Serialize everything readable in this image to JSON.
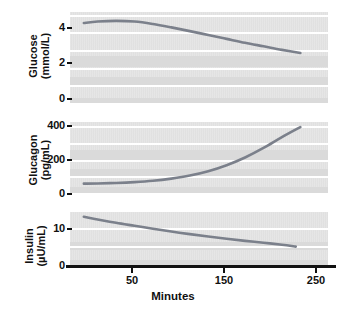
{
  "figure": {
    "xlabel": "Minutes",
    "line_color": "#7b808b",
    "panel_bg": "#e3e3e3",
    "band_color": "#dadada",
    "gridline_color": "#ffffff",
    "axis_color": "#111111"
  },
  "chart_data": [
    {
      "type": "line",
      "title": "",
      "xlabel": "Minutes",
      "ylabel": "Glucose (mmol/L)",
      "ylabel_lines": [
        "Glucose",
        "(mmol/L)"
      ],
      "units": "mmol/L",
      "xlim": [
        0,
        280
      ],
      "ylim": [
        0,
        5.2
      ],
      "yticks": [
        0,
        2,
        4
      ],
      "ytick_labels": [
        "0",
        "2",
        "4"
      ],
      "xticks": [
        50,
        150,
        250
      ],
      "xtick_labels": [
        "50",
        "150",
        "250"
      ],
      "grid": true,
      "legend": "none",
      "series": [
        {
          "name": "Glucose",
          "x": [
            15,
            30,
            50,
            70,
            90,
            110,
            130,
            150,
            170,
            190,
            210,
            230,
            250
          ],
          "values": [
            4.58,
            4.66,
            4.7,
            4.66,
            4.52,
            4.33,
            4.12,
            3.9,
            3.68,
            3.46,
            3.26,
            3.06,
            2.88
          ]
        }
      ]
    },
    {
      "type": "line",
      "title": "",
      "xlabel": "Minutes",
      "ylabel": "Glucagon (pg/mL)",
      "ylabel_lines": [
        "Glucagon",
        "(pg/mL)"
      ],
      "units": "pg/mL",
      "xlim": [
        0,
        280
      ],
      "ylim": [
        0,
        430
      ],
      "yticks": [
        0,
        200,
        400
      ],
      "ytick_labels": [
        "0",
        "200",
        "400"
      ],
      "xticks": [
        50,
        150,
        250
      ],
      "xtick_labels": [
        "50",
        "150",
        "250"
      ],
      "grid": true,
      "legend": "none",
      "series": [
        {
          "name": "Glucagon",
          "x": [
            15,
            30,
            50,
            70,
            90,
            110,
            130,
            150,
            170,
            190,
            210,
            230,
            250
          ],
          "values": [
            62,
            63,
            66,
            71,
            79,
            92,
            110,
            136,
            172,
            218,
            275,
            340,
            400
          ]
        }
      ]
    },
    {
      "type": "line",
      "title": "",
      "xlabel": "Minutes",
      "ylabel": "Insulin (µU/mL)",
      "ylabel_lines": [
        "Insulin",
        "(µU/mL)"
      ],
      "units": "µU/mL",
      "xlim": [
        0,
        280
      ],
      "ylim": [
        0,
        14.5
      ],
      "yticks": [
        0,
        10
      ],
      "ytick_labels": [
        "0",
        "10"
      ],
      "xticks": [
        50,
        150,
        250
      ],
      "xtick_labels": [
        "50",
        "150",
        "250"
      ],
      "grid": true,
      "legend": "none",
      "series": [
        {
          "name": "Insulin",
          "x": [
            15,
            30,
            50,
            70,
            90,
            110,
            130,
            150,
            170,
            190,
            210,
            230,
            245
          ],
          "values": [
            13.2,
            12.5,
            11.6,
            10.8,
            10.0,
            9.25,
            8.55,
            7.9,
            7.3,
            6.75,
            6.25,
            5.7,
            5.2
          ]
        }
      ]
    }
  ]
}
